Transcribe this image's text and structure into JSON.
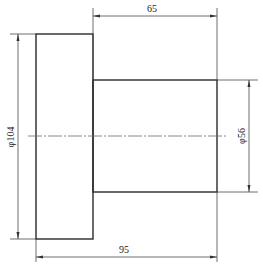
{
  "drawing": {
    "type": "stepped-shaft-side-view",
    "dimensions": {
      "step_length": "65",
      "total_length": "95",
      "large_diameter": "φ104",
      "small_diameter": "φ56"
    },
    "colors": {
      "line": "#2a2a2a",
      "background": "#ffffff"
    }
  }
}
